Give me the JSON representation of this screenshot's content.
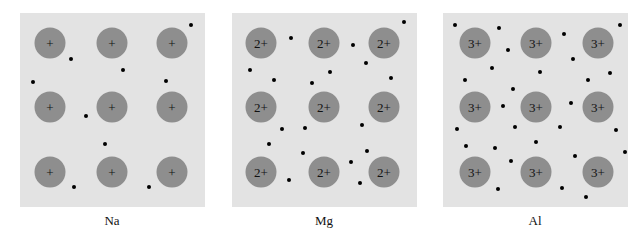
{
  "panels": [
    {
      "label": "Na",
      "x": 20,
      "charge": "+",
      "ions_x": [
        30,
        92,
        152
      ],
      "ions_y": [
        30,
        94,
        159
      ],
      "electrons": [
        [
          171,
          12
        ],
        [
          51,
          46
        ],
        [
          103,
          57
        ],
        [
          13,
          69
        ],
        [
          146,
          68
        ],
        [
          66,
          103
        ],
        [
          85,
          131
        ],
        [
          54,
          174
        ],
        [
          129,
          174
        ]
      ]
    },
    {
      "label": "Mg",
      "x": 232,
      "charge": "2+",
      "ions_x": [
        29,
        92,
        152
      ],
      "ions_y": [
        30,
        94,
        159
      ],
      "electrons": [
        [
          172,
          9
        ],
        [
          59,
          25
        ],
        [
          121,
          32
        ],
        [
          18,
          57
        ],
        [
          134,
          50
        ],
        [
          42,
          67
        ],
        [
          98,
          59
        ],
        [
          159,
          65
        ],
        [
          80,
          70
        ],
        [
          50,
          116
        ],
        [
          73,
          115
        ],
        [
          130,
          112
        ],
        [
          37,
          131
        ],
        [
          71,
          140
        ],
        [
          135,
          138
        ],
        [
          119,
          149
        ],
        [
          57,
          167
        ],
        [
          128,
          170
        ]
      ]
    },
    {
      "label": "Al",
      "x": 443,
      "charge": "3+",
      "ions_x": [
        32,
        93,
        155
      ],
      "ions_y": [
        30,
        94,
        159
      ],
      "electrons": [
        [
          12,
          12
        ],
        [
          56,
          15
        ],
        [
          121,
          21
        ],
        [
          177,
          12
        ],
        [
          65,
          37
        ],
        [
          130,
          46
        ],
        [
          49,
          55
        ],
        [
          97,
          59
        ],
        [
          167,
          60
        ],
        [
          22,
          67
        ],
        [
          145,
          67
        ],
        [
          70,
          76
        ],
        [
          60,
          93
        ],
        [
          128,
          90
        ],
        [
          72,
          114
        ],
        [
          117,
          114
        ],
        [
          14,
          116
        ],
        [
          173,
          117
        ],
        [
          23,
          133
        ],
        [
          52,
          135
        ],
        [
          93,
          129
        ],
        [
          182,
          139
        ],
        [
          68,
          148
        ],
        [
          132,
          143
        ],
        [
          55,
          176
        ],
        [
          119,
          175
        ],
        [
          143,
          184
        ]
      ]
    }
  ]
}
